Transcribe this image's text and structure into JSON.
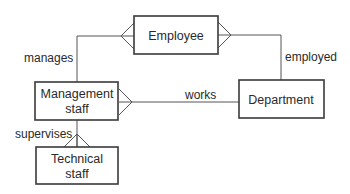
{
  "diagram": {
    "type": "entity-relationship",
    "entities": {
      "employee": {
        "label": "Employee"
      },
      "management_staff": {
        "line1": "Management",
        "line2": "staff"
      },
      "department": {
        "label": "Department"
      },
      "technical_staff": {
        "line1": "Technical",
        "line2": "staff"
      }
    },
    "relationships": {
      "manages": {
        "label": "manages",
        "from": "Management staff",
        "to": "Employee",
        "many_end": "Employee"
      },
      "employed": {
        "label": "employed",
        "from": "Employee",
        "to": "Department",
        "many_end": "Employee"
      },
      "works": {
        "label": "works",
        "from": "Management staff",
        "to": "Department",
        "many_end": "Management staff"
      },
      "supervises": {
        "label": "supervises",
        "from": "Management staff",
        "to": "Technical staff",
        "many_end": "Technical staff"
      }
    }
  }
}
